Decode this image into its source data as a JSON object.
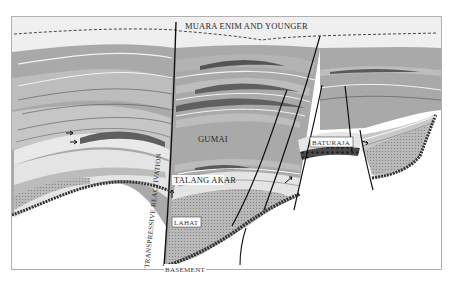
{
  "diagram": {
    "type": "geological-cross-section",
    "colors": {
      "background": "#ffffff",
      "frame": "#b0b0b0",
      "sky": "#efefef",
      "upper_shale": "#a9a9a9",
      "mid_shale": "#bdbdbd",
      "light_band": "#e9e9e9",
      "dark_lens": "#6a6a6a",
      "lahat_fill": "#b4b4b4",
      "basement_edge": "#3c3c3c",
      "fault_line": "#111111",
      "dashed_unconformity": "#333333"
    },
    "labels": {
      "muara_enim": "MUARA ENIM AND YOUNGER",
      "gumai": "GUMAI",
      "baturaja": "BATURAJA",
      "talang_akar": "TALANG AKAR",
      "lahat": "LAHAT",
      "basement": "BASEMENT",
      "fault": "TRANSPRESSIVE REACTIVATION"
    },
    "units": [
      {
        "name": "Muara Enim and Younger",
        "position": "top"
      },
      {
        "name": "Gumai",
        "position": "upper-middle"
      },
      {
        "name": "Baturaja",
        "position": "carbonate platform on horst"
      },
      {
        "name": "Talang Akar",
        "position": "lower-middle"
      },
      {
        "name": "Lahat",
        "position": "graben fill"
      },
      {
        "name": "Basement",
        "position": "base"
      }
    ],
    "structures": [
      {
        "type": "fault",
        "label": "Transpressive Reactivation"
      },
      {
        "type": "unconformity",
        "style": "dashed"
      }
    ]
  }
}
